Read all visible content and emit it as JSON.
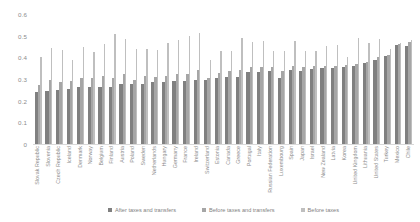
{
  "chart_data": {
    "type": "bar",
    "title": "",
    "subtitle": "",
    "xlabel": "",
    "ylabel": "",
    "ylim": [
      0,
      0.6
    ],
    "ytick_labels": [
      "0",
      "0.1",
      "0.2",
      "0.3",
      "0.4",
      "0.5",
      "0.6"
    ],
    "ytick_values": [
      0,
      0.1,
      0.2,
      0.3,
      0.4,
      0.5,
      0.6
    ],
    "grid": false,
    "legend_position": "bottom",
    "categories": [
      "Slovak Republic",
      "Slovenia",
      "Czech Republic",
      "Iceland",
      "Denmark",
      "Norway",
      "Belgium",
      "Finland",
      "Austria",
      "Poland",
      "Sweden",
      "Netherlands",
      "Hungary",
      "Germany",
      "France",
      "Ireland",
      "Switzerland",
      "Estonia",
      "Canada",
      "Greece",
      "Portugal",
      "Italy",
      "Russian Federation",
      "Luxembourg",
      "Spain",
      "Japan",
      "Israel",
      "New Zealand",
      "Latvia",
      "Korea",
      "United Kingdom",
      "Lithuania",
      "United States",
      "Turkey",
      "Mexico",
      "Chile"
    ],
    "series": [
      {
        "name": "After taxes and transfers",
        "color": "#808080",
        "values": [
          0.241,
          0.244,
          0.249,
          0.255,
          0.261,
          0.262,
          0.264,
          0.264,
          0.275,
          0.277,
          0.278,
          0.285,
          0.288,
          0.289,
          0.291,
          0.295,
          0.296,
          0.304,
          0.307,
          0.309,
          0.332,
          0.333,
          0.335,
          0.306,
          0.341,
          0.339,
          0.346,
          0.349,
          0.352,
          0.355,
          0.358,
          0.372,
          0.39,
          0.404,
          0.459,
          0.454
        ]
      },
      {
        "name": "Before taxes and transfers",
        "color": "#a6a6a6",
        "values": [
          0.272,
          0.295,
          0.286,
          0.291,
          0.304,
          0.303,
          0.313,
          0.304,
          0.322,
          0.295,
          0.313,
          0.311,
          0.316,
          0.323,
          0.324,
          0.341,
          0.304,
          0.33,
          0.336,
          0.34,
          0.354,
          0.357,
          0.356,
          0.338,
          0.362,
          0.357,
          0.359,
          0.361,
          0.362,
          0.366,
          0.369,
          0.38,
          0.402,
          0.412,
          0.462,
          0.47
        ]
      },
      {
        "name": "Before taxes",
        "color": "#bfbfbf",
        "values": [
          0.4,
          0.444,
          0.436,
          0.39,
          0.446,
          0.424,
          0.46,
          0.508,
          0.485,
          0.437,
          0.44,
          0.434,
          0.466,
          0.481,
          0.497,
          0.512,
          0.386,
          0.43,
          0.431,
          0.487,
          0.471,
          0.476,
          0.428,
          0.43,
          0.477,
          0.428,
          0.429,
          0.452,
          0.457,
          0.401,
          0.49,
          0.465,
          0.484,
          0.438,
          0.464,
          0.482
        ]
      }
    ]
  },
  "legend": {
    "items": [
      {
        "label": "After taxes and transfers",
        "color": "#808080"
      },
      {
        "label": "Before taxes and transfers",
        "color": "#a6a6a6"
      },
      {
        "label": "Before taxes",
        "color": "#bfbfbf"
      }
    ]
  }
}
